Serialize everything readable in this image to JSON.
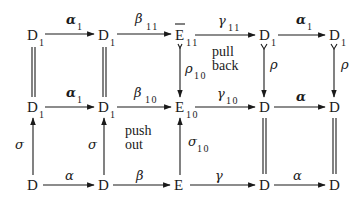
{
  "diagram": {
    "nodes": {
      "r0c0": {
        "base": "D",
        "sub": "1"
      },
      "r0c1": {
        "base": "D",
        "sub": "1"
      },
      "r0c2": {
        "base": "E",
        "sub": "11",
        "overbar": true
      },
      "r0c3": {
        "base": "D",
        "sub": "1"
      },
      "r0c4": {
        "base": "D",
        "sub": "1"
      },
      "r1c0": {
        "base": "D",
        "sub": "1"
      },
      "r1c1": {
        "base": "D",
        "sub": "1"
      },
      "r1c2": {
        "base": "E",
        "sub": "10"
      },
      "r1c3": {
        "base": "D",
        "sub": ""
      },
      "r1c4": {
        "base": "D",
        "sub": ""
      },
      "r2c0": {
        "base": "D",
        "sub": ""
      },
      "r2c1": {
        "base": "D",
        "sub": ""
      },
      "r2c2": {
        "base": "E",
        "sub": ""
      },
      "r2c3": {
        "base": "D",
        "sub": ""
      },
      "r2c4": {
        "base": "D",
        "sub": ""
      }
    },
    "arrows": {
      "top_alpha1_a": {
        "sym": "α",
        "sub": "1"
      },
      "top_beta11": {
        "sym": "β",
        "sub": "11"
      },
      "top_gamma11": {
        "sym": "γ",
        "sub": "11"
      },
      "top_alpha1_b": {
        "sym": "α",
        "sub": "1"
      },
      "mid_alpha1": {
        "sym": "α",
        "sub": "1"
      },
      "mid_beta10": {
        "sym": "β",
        "sub": "10"
      },
      "mid_gamma10": {
        "sym": "γ",
        "sub": "10"
      },
      "mid_alpha": {
        "sym": "α",
        "sub": ""
      },
      "bot_alpha_a": {
        "sym": "α",
        "sub": ""
      },
      "bot_beta": {
        "sym": "β",
        "sub": ""
      },
      "bot_gamma": {
        "sym": "γ",
        "sub": ""
      },
      "bot_alpha_b": {
        "sym": "α",
        "sub": ""
      },
      "rho10": {
        "sym": "ρ",
        "sub": "10"
      },
      "rho_a": {
        "sym": "ρ",
        "sub": ""
      },
      "rho_b": {
        "sym": "ρ",
        "sub": ""
      },
      "sigma_a": {
        "sym": "σ",
        "sub": ""
      },
      "sigma_b": {
        "sym": "σ",
        "sub": ""
      },
      "sigma10": {
        "sym": "σ",
        "sub": "10"
      }
    },
    "annotations": {
      "pullback": [
        "pull",
        "back"
      ],
      "pushout": [
        "push",
        "out"
      ]
    }
  }
}
